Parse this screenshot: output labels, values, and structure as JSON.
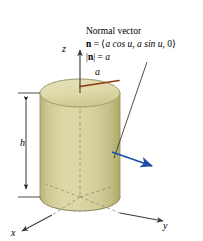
{
  "figure": {
    "title_text": "Normal vector",
    "background_color": "#ffffff",
    "annotation": {
      "line1": "Normal vector",
      "line2_vector_symbol": "n",
      "line2_equals": "=",
      "line2_open": "⟨",
      "line2_component_x": "a cos u",
      "line2_sep": ",",
      "line2_component_y": "a sin u",
      "line2_component_z": "0",
      "line2_close": "⟩",
      "line3_magnitude_open": "|",
      "line3_vector_symbol": "n",
      "line3_magnitude_close": "|",
      "line3_equals": "=",
      "line3_value": "a"
    },
    "axes": {
      "z_label": "z",
      "y_label": "y",
      "x_label": "x",
      "axis_color": "#3a3a3a"
    },
    "dimensions": {
      "height_label": "h",
      "radius_label": "a",
      "radius_line_color": "#8b3a10",
      "dimension_line_color": "#222222"
    },
    "surface": {
      "name": "cylinder",
      "fill_top_color": "#ddd9a8",
      "fill_side_light": "#d7d2a0",
      "fill_side_dark": "#b8b377",
      "edge_color": "#9a9668",
      "hidden_edge_style": "dashed"
    },
    "normal_vector_arrow": {
      "color": "#1d4fa8",
      "direction": "outward-right-down"
    },
    "leader_line": {
      "color": "#3a3a3a"
    }
  }
}
